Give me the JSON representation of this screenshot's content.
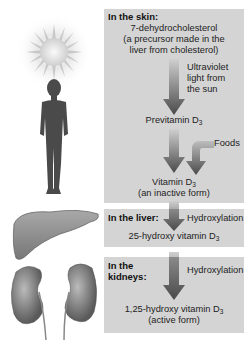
{
  "skin_box": {
    "header": "In the skin:",
    "precursor_line1": "7-dehydrocholesterol",
    "precursor_line2": "(a precursor made in the",
    "precursor_line3": "liver from cholesterol)",
    "uv_line1": "Ultraviolet",
    "uv_line2": "light from",
    "uv_line3": "the sun",
    "previtamin": "Previtamin D",
    "previtamin_sub": "3",
    "foods": "Foods",
    "vitamin": "Vitamin D",
    "vitamin_sub": "3",
    "vitamin_note": "(an inactive form)"
  },
  "liver_box": {
    "header": "In the liver:",
    "process": "Hydroxylation",
    "product": "25-hydroxy vitamin D",
    "product_sub": "3"
  },
  "kidney_box": {
    "header_line1": "In the",
    "header_line2": "kidneys:",
    "process": "Hydroxylation",
    "product": "1,25-hydroxy vitamin D",
    "product_sub": "3",
    "product_note": "(active form)"
  },
  "colors": {
    "box_bg": "#d4d4d4",
    "arrow_top": "#cfcfcf",
    "arrow_bottom": "#4a4a4a",
    "figure": "#4a4a4a",
    "organ": "#8a8a8a"
  }
}
